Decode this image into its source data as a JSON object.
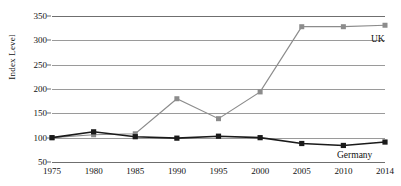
{
  "chart_data": {
    "type": "line",
    "title": "",
    "xlabel": "",
    "ylabel": "Index Level",
    "categories": [
      "1975",
      "1980",
      "1985",
      "1990",
      "1995",
      "2000",
      "2005",
      "2010",
      "2014"
    ],
    "x": [
      1975,
      1980,
      1985,
      1990,
      1995,
      2000,
      2005,
      2010,
      2014
    ],
    "ylim": [
      50,
      350
    ],
    "yticks": [
      50,
      100,
      150,
      200,
      250,
      300,
      350
    ],
    "ytick_labels": [
      "50",
      "100",
      "150",
      "200",
      "250",
      "300",
      "350"
    ],
    "grid": true,
    "legend_position": "inline-end-of-line",
    "series": [
      {
        "name": "UK",
        "color": "#8c8c8c",
        "marker": "square",
        "values": [
          100,
          106,
          108,
          180,
          139,
          194,
          328,
          328,
          331
        ]
      },
      {
        "name": "Germany",
        "color": "#1a1a1a",
        "marker": "square",
        "values": [
          100,
          112,
          102,
          99,
          103,
          100,
          88,
          84,
          91
        ]
      }
    ],
    "annotations": [
      {
        "text": "UK",
        "series": "UK"
      },
      {
        "text": "Germany",
        "series": "Germany"
      }
    ]
  },
  "colors": {
    "uk": "#8c8c8c",
    "germany": "#1a1a1a",
    "gridline": "#9a9a9a",
    "axis": "#6f6f6f",
    "background": "#ffffff",
    "text": "#111111"
  }
}
